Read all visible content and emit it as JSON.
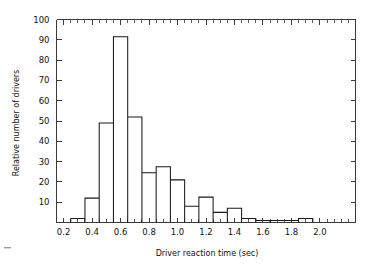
{
  "chart_data": {
    "type": "bar",
    "title": "",
    "subtitle": "",
    "xlabel": "Driver reaction time (sec)",
    "ylabel": "Relative number of drivers",
    "xlim": [
      0.15,
      2.25
    ],
    "ylim": [
      0,
      100
    ],
    "grid": false,
    "legend": "none",
    "bin_width": 0.1,
    "x_ticks": [
      0.2,
      0.4,
      0.6,
      0.8,
      1.0,
      1.2,
      1.4,
      1.6,
      1.8,
      2.0
    ],
    "x_tick_labels": [
      "0.2",
      "0.4",
      "0.6",
      "0.8",
      "1.0",
      "1.2",
      "1.4",
      "1.6",
      "1.8",
      "2.0"
    ],
    "x_minor_tick_step": 0.05,
    "y_ticks": [
      10,
      20,
      30,
      40,
      50,
      60,
      70,
      80,
      90,
      100
    ],
    "y_tick_labels": [
      "10",
      "20",
      "30",
      "40",
      "50",
      "60",
      "70",
      "80",
      "90",
      "100"
    ],
    "bin_edges": [
      0.25,
      0.35,
      0.45,
      0.55,
      0.65,
      0.75,
      0.85,
      0.95,
      1.05,
      1.15,
      1.25,
      1.35,
      1.45,
      1.55,
      1.65,
      1.85,
      1.95,
      2.05
    ],
    "categories": [
      "0.25-0.35",
      "0.35-0.45",
      "0.45-0.55",
      "0.55-0.65",
      "0.65-0.75",
      "0.75-0.85",
      "0.85-0.95",
      "0.95-1.05",
      "1.05-1.15",
      "1.15-1.25",
      "1.25-1.35",
      "1.35-1.45",
      "1.45-1.55",
      "1.55-1.65",
      "1.85-1.95",
      "1.95-2.05"
    ],
    "values": [
      2,
      12,
      49,
      91.5,
      52,
      24.5,
      27.5,
      21,
      8,
      12.5,
      5,
      7,
      2,
      1,
      1,
      2
    ]
  },
  "figure": {
    "caption": ""
  }
}
